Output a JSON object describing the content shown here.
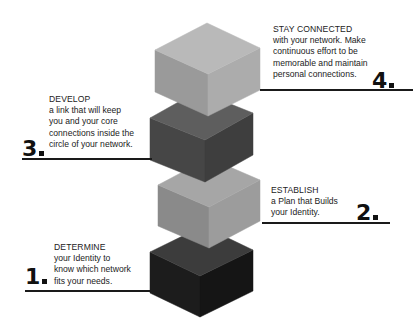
{
  "diagram": {
    "type": "stacked-cube-steps",
    "steps": [
      {
        "number": "1",
        "heading": "DETERMINE",
        "lines": [
          "your Identity to",
          "know which network",
          "fits your needs."
        ],
        "cube_colors": {
          "top": "#3c3c3c",
          "left": "#1c1c1c",
          "right": "#151515"
        }
      },
      {
        "number": "2",
        "heading": "ESTABLISH",
        "lines": [
          "a Plan that Builds",
          "your Identity."
        ],
        "cube_colors": {
          "top": "#a6a6a6",
          "left": "#8a8a8a",
          "right": "#9c9c9c"
        }
      },
      {
        "number": "3",
        "heading": "DEVELOP",
        "lines": [
          "a link that will keep",
          "you and your core",
          "connections inside the",
          "circle of your network."
        ],
        "cube_colors": {
          "top": "#5e5e5e",
          "left": "#464646",
          "right": "#3e3e3e"
        }
      },
      {
        "number": "4",
        "heading": "STAY CONNECTED",
        "lines": [
          "with your network. Make",
          "continuous effort to be",
          "memorable and maintain",
          "personal connections."
        ],
        "cube_colors": {
          "top": "#b9b9b9",
          "left": "#9a9a9a",
          "right": "#acacac"
        }
      }
    ]
  }
}
